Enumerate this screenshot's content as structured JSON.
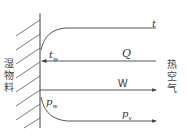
{
  "diagram": {
    "left_label": "湿物料",
    "right_label": "热空气",
    "labels": {
      "t": "t",
      "t_w_base": "t",
      "t_w_sub": "w",
      "Q": "Q",
      "W": "W",
      "p_w_base": "p",
      "p_w_sub": "w",
      "p_v_base": "p",
      "p_v_sub": "v"
    },
    "colors": {
      "line": "#444444",
      "text": "#333333"
    }
  }
}
